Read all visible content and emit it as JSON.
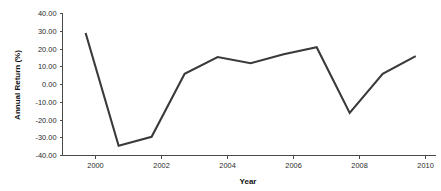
{
  "chart_data": {
    "type": "line",
    "title": "",
    "xlabel": "Year",
    "ylabel": "Annual Return (%)",
    "xlim": [
      1999.0,
      2010.3
    ],
    "ylim": [
      -40.0,
      40.0
    ],
    "grid": false,
    "legend": false,
    "line_color": "#3a3a3a",
    "axis_color": "#4a4a4a",
    "background_color": "#ffffff",
    "x_ticks": [
      2000,
      2002,
      2004,
      2006,
      2008,
      2010
    ],
    "x_tick_labels": [
      "2000",
      "2002",
      "2004",
      "2006",
      "2008",
      "2010"
    ],
    "y_ticks": [
      40.0,
      30.0,
      20.0,
      10.0,
      0.0,
      -10.0,
      -20.0,
      -30.0,
      -40.0
    ],
    "y_tick_labels": [
      "40.00",
      "30.00",
      "20.00",
      "10.00",
      "0.00",
      "-10.00",
      "-20.00",
      "-30.00",
      "-40.00"
    ],
    "series": [
      {
        "name": "Annual Return",
        "x": [
          1999.7,
          2000.7,
          2001.7,
          2002.7,
          2003.7,
          2004.7,
          2005.7,
          2006.7,
          2007.7,
          2008.7,
          2009.7
        ],
        "values": [
          29.0,
          -34.5,
          -29.5,
          6.0,
          15.5,
          12.0,
          17.0,
          21.0,
          -16.0,
          6.0,
          16.0
        ]
      }
    ]
  }
}
